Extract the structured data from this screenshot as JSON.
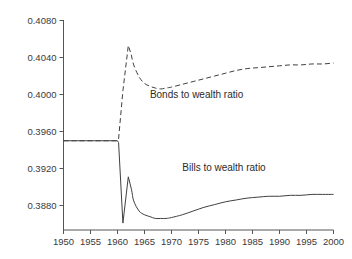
{
  "chart_data": {
    "type": "line",
    "title": "",
    "xlabel": "",
    "ylabel": "",
    "xlim": [
      1950,
      2000
    ],
    "ylim": [
      0.388,
      0.408
    ],
    "grid": false,
    "legend_position": "inline-annotations",
    "xticks": [
      1950,
      1955,
      1960,
      1965,
      1970,
      1975,
      1980,
      1985,
      1990,
      1995,
      2000
    ],
    "xtick_labels": [
      "1950",
      "1955",
      "1960",
      "1965",
      "1970",
      "1975",
      "1980",
      "1985",
      "1990",
      "1995",
      "2000"
    ],
    "yticks": [
      0.388,
      0.392,
      0.396,
      0.4,
      0.404,
      0.408
    ],
    "ytick_labels": [
      "0.3880",
      "0.3920",
      "0.3960",
      "0.4000",
      "0.4040",
      "0.4080"
    ],
    "annotations": [
      {
        "text": "Bonds to wealth ratio",
        "x": 1966.0,
        "y": 0.3996
      },
      {
        "text": "Bills to wealth ratio",
        "x": 1972.0,
        "y": 0.3917
      }
    ],
    "series": [
      {
        "name": "Bonds to wealth ratio",
        "linestyle": "dashed",
        "color": "#404040",
        "x": [
          1950,
          1952,
          1954,
          1956,
          1958,
          1960,
          1960.2,
          1961,
          1962,
          1962.5,
          1963,
          1964,
          1965,
          1966,
          1967,
          1968,
          1969,
          1970,
          1972,
          1974,
          1976,
          1978,
          1980,
          1982,
          1984,
          1986,
          1988,
          1990,
          1992,
          1994,
          1996,
          1998,
          2000
        ],
        "y": [
          0.395,
          0.395,
          0.395,
          0.395,
          0.395,
          0.395,
          0.3952,
          0.4004,
          0.4053,
          0.4044,
          0.4032,
          0.4019,
          0.4012,
          0.4009,
          0.4007,
          0.4006,
          0.4007,
          0.4008,
          0.4011,
          0.4014,
          0.4017,
          0.402,
          0.4023,
          0.4026,
          0.4028,
          0.4029,
          0.403,
          0.4031,
          0.4032,
          0.4032,
          0.4033,
          0.4033,
          0.4034
        ]
      },
      {
        "name": "Bills to wealth ratio",
        "linestyle": "solid",
        "color": "#404040",
        "x": [
          1950,
          1952,
          1954,
          1956,
          1958,
          1960,
          1960.2,
          1961,
          1962,
          1962.6,
          1963,
          1964,
          1965,
          1966,
          1967,
          1968,
          1969,
          1970,
          1972,
          1974,
          1976,
          1978,
          1980,
          1982,
          1984,
          1986,
          1988,
          1990,
          1992,
          1994,
          1996,
          1998,
          2000
        ],
        "y": [
          0.395,
          0.395,
          0.395,
          0.395,
          0.395,
          0.395,
          0.3948,
          0.3861,
          0.3911,
          0.3897,
          0.3885,
          0.3874,
          0.387,
          0.3868,
          0.3866,
          0.3866,
          0.3866,
          0.3867,
          0.387,
          0.3874,
          0.3878,
          0.3881,
          0.3884,
          0.3886,
          0.3888,
          0.3889,
          0.389,
          0.389,
          0.3891,
          0.3891,
          0.3892,
          0.3892,
          0.3892
        ]
      }
    ]
  }
}
